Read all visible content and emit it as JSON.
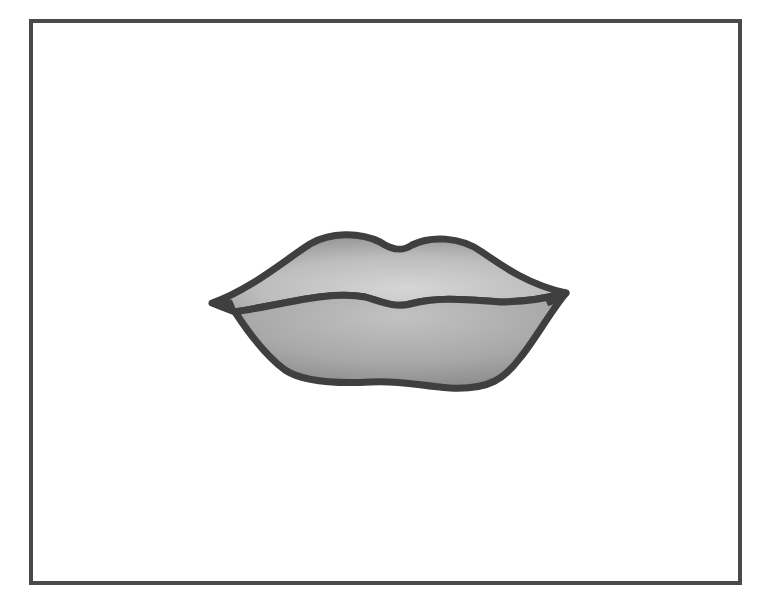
{
  "image": {
    "subject": "lips-illustration",
    "description": "Grayscale cartoon drawing of closed lips inside a rectangular frame",
    "alt_text": "Cartoon lips"
  },
  "colors": {
    "background": "#ffffff",
    "frame_border": "#4a4a4a",
    "lip_outline": "#3f3f3f",
    "lip_fill_light": "#d2d2d2",
    "lip_fill_mid": "#b3b3b3",
    "lip_fill_dark": "#8e8e8e"
  }
}
